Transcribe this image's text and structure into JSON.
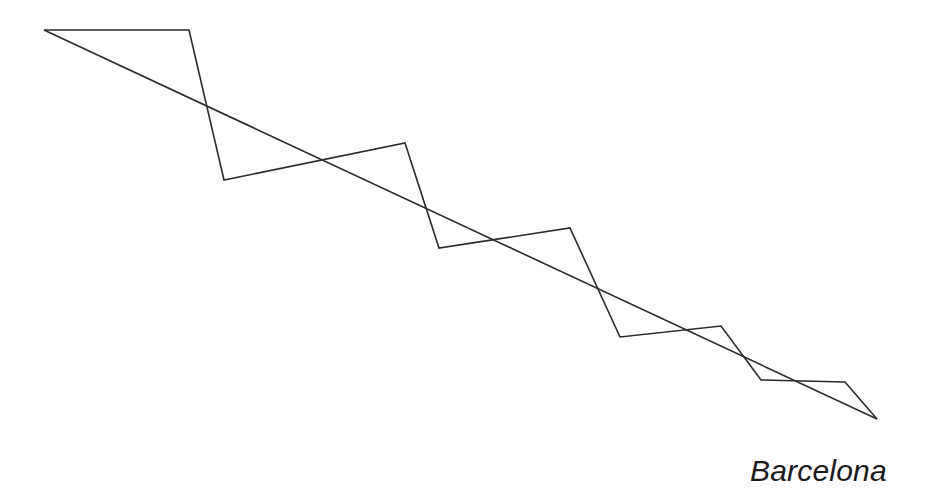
{
  "diagram": {
    "type": "line-figure",
    "stroke_color": "#2b2b2b",
    "background_color": "#ffffff",
    "zigzag_path": [
      [
        44,
        30
      ],
      [
        189,
        30
      ],
      [
        224,
        180
      ],
      [
        405,
        143
      ],
      [
        439,
        248
      ],
      [
        570,
        228
      ],
      [
        620,
        337
      ],
      [
        721,
        326
      ],
      [
        761,
        380
      ],
      [
        845,
        382
      ],
      [
        877,
        419
      ]
    ],
    "diagonal_line": {
      "from": [
        44,
        30
      ],
      "to": [
        877,
        419
      ]
    }
  },
  "caption": {
    "text": "Barcelona"
  }
}
